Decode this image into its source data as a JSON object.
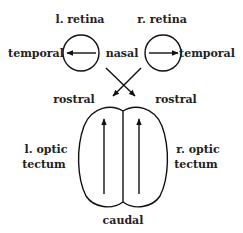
{
  "diagram": {
    "labels": {
      "left_retina": "l. retina",
      "right_retina": "r. retina",
      "temporal_left": "temporal",
      "nasal": "nasal",
      "temporal_right": "temporal",
      "rostral_left": "rostral",
      "rostral_right": "rostral",
      "left_tectum_line1": "l. optic",
      "left_tectum_line2": "tectum",
      "right_tectum_line1": "r. optic",
      "right_tectum_line2": "tectum",
      "caudal": "caudal"
    },
    "nodes": [
      {
        "id": "left-retina",
        "label": "l. retina",
        "arrow": "temporal (left)"
      },
      {
        "id": "right-retina",
        "label": "r. retina",
        "arrow": "temporal (right)"
      },
      {
        "id": "left-tectum",
        "label": "l. optic tectum",
        "arrow": "rostral"
      },
      {
        "id": "right-tectum",
        "label": "r. optic tectum",
        "arrow": "rostral"
      }
    ],
    "edges": [
      {
        "from": "left-retina",
        "to": "right-tectum"
      },
      {
        "from": "right-retina",
        "to": "left-tectum"
      }
    ],
    "colors": {
      "ink": "#111111",
      "background": "#ffffff"
    }
  }
}
